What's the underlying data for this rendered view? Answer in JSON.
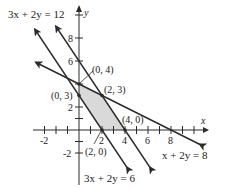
{
  "diagram": {
    "axes": {
      "x_label": "x",
      "y_label": "y",
      "x_ticks": [
        "-2",
        "2",
        "4",
        "6",
        "8"
      ],
      "y_ticks": [
        "-2",
        "2",
        "6",
        "8"
      ]
    },
    "lines": [
      {
        "label": "3x + 2y = 12",
        "equation": "3x+2y=12"
      },
      {
        "label": "3x + 2y = 6",
        "equation": "3x+2y=6"
      },
      {
        "label": "x + 2y = 8",
        "equation": "x+2y=8"
      }
    ],
    "points": [
      {
        "label": "(0, 4)"
      },
      {
        "label": "(2, 3)"
      },
      {
        "label": "(0, 3)"
      },
      {
        "label": "(4, 0)"
      },
      {
        "label": "(2, 0)"
      }
    ],
    "region_color": "#d9d9d9",
    "line_color": "#2a2a2a"
  }
}
